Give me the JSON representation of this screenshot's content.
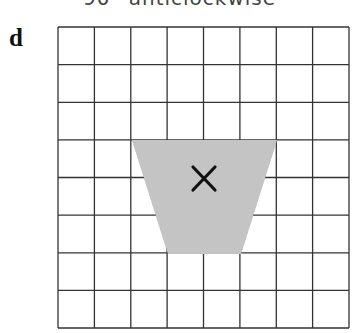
{
  "caption": "90° anticlockwise",
  "panel_label": "d",
  "grid": {
    "columns": 8,
    "rows": 8,
    "line_color": "#333333"
  },
  "shape": {
    "type": "trapezoid",
    "fill": "#c4c4c4",
    "marker": "×",
    "marker_name": "center-of-rotation"
  }
}
